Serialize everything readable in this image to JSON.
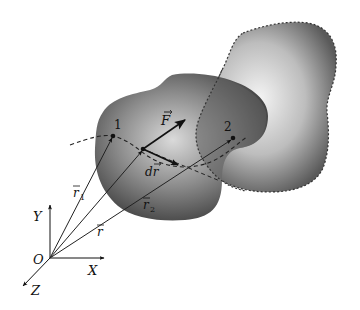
{
  "diagram": {
    "type": "physics-vector-diagram",
    "axes": {
      "origin_label": "O",
      "x_label": "X",
      "y_label": "Y",
      "z_label": "Z"
    },
    "points": [
      {
        "id": "point-1",
        "label": "1"
      },
      {
        "id": "point-2",
        "label": "2"
      }
    ],
    "vectors": {
      "r1": {
        "label": "r",
        "subscript": "1"
      },
      "r": {
        "label": "r",
        "subscript": ""
      },
      "r2": {
        "label": "r",
        "subscript": "2"
      },
      "force": {
        "label": "F"
      },
      "displacement": {
        "label": "dr",
        "prefix": "d",
        "symbol": "r"
      }
    },
    "bodies": [
      {
        "id": "body-initial",
        "outline": "solid"
      },
      {
        "id": "body-final",
        "outline": "dashed"
      }
    ],
    "trajectory": {
      "style": "dashed"
    },
    "colors": {
      "ink": "#111111",
      "body_dark": "#3a3a3a",
      "body_light": "#e8e8e8",
      "background": "#ffffff"
    }
  }
}
